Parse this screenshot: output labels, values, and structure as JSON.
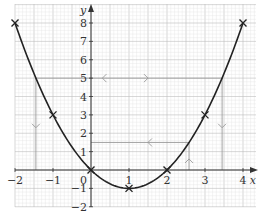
{
  "chart_data": {
    "type": "line",
    "title": "",
    "xlabel": "x",
    "ylabel": "y",
    "xlim": [
      -2,
      4
    ],
    "ylim": [
      -2,
      8
    ],
    "grid": true,
    "function": "y = x^2 - 2x",
    "x_ticks": [
      "-2",
      "-1",
      "0",
      "1",
      "2",
      "3",
      "4"
    ],
    "y_ticks": [
      "-2",
      "-1",
      "1",
      "2",
      "3",
      "4",
      "5",
      "6",
      "7",
      "8"
    ],
    "origin_label": "0",
    "series": [
      {
        "name": "curve",
        "marked_points": [
          {
            "x": -2,
            "y": 8
          },
          {
            "x": -1,
            "y": 3
          },
          {
            "x": 0,
            "y": 0
          },
          {
            "x": 1,
            "y": -1
          },
          {
            "x": 2,
            "y": 0
          },
          {
            "x": 3,
            "y": 3
          },
          {
            "x": 4,
            "y": 8
          }
        ]
      }
    ],
    "construction_lines": [
      {
        "type": "horizontal",
        "y": 5,
        "x_from": -1.45,
        "x_to": 3.45,
        "arrows": [
          {
            "x": 0.3,
            "dir": "left"
          },
          {
            "x": 1.5,
            "dir": "right"
          }
        ]
      },
      {
        "type": "vertical",
        "x": -1.45,
        "y_from": 5,
        "y_to": 0,
        "arrows": [
          {
            "y": 2.3,
            "dir": "down"
          }
        ]
      },
      {
        "type": "vertical",
        "x": 3.45,
        "y_from": 5,
        "y_to": 0,
        "arrows": [
          {
            "y": 2.3,
            "dir": "down"
          }
        ]
      },
      {
        "type": "horizontal",
        "y": 1.5,
        "x_from": 0,
        "x_to": 2.58,
        "arrows": [
          {
            "x": 1.5,
            "dir": "left"
          }
        ]
      },
      {
        "type": "vertical",
        "x": 2.58,
        "y_from": 0,
        "y_to": 1.5,
        "arrows": [
          {
            "y": 0.6,
            "dir": "up"
          }
        ]
      }
    ]
  },
  "colors": {
    "curve": "#222222",
    "axis": "#333333",
    "grid_minor": "#e2e2e2",
    "grid_major": "#bdbdbd",
    "construction": "#999999"
  }
}
